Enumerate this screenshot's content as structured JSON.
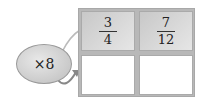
{
  "operator": {
    "label": "×8"
  },
  "grid": {
    "rows": [
      [
        {
          "numerator": "3",
          "denominator": "4"
        },
        {
          "numerator": "7",
          "denominator": "12"
        }
      ],
      [
        {
          "numerator": "",
          "denominator": ""
        },
        {
          "numerator": "",
          "denominator": ""
        }
      ]
    ]
  },
  "colors": {
    "top_cell": "#d4d4d4",
    "bottom_cell": "#ffffff",
    "border": "#aaaaaa",
    "bubble": "#cfcfcf"
  }
}
